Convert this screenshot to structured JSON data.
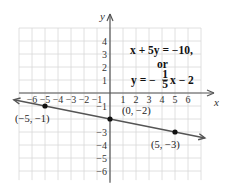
{
  "chart_data": {
    "type": "line",
    "title": "",
    "xlabel": "x",
    "ylabel": "y",
    "xlim": [
      -6,
      6
    ],
    "ylim": [
      -6,
      4
    ],
    "grid": true,
    "x_ticks": [
      "-6",
      "-5",
      "-4",
      "-3",
      "-2",
      "-1",
      "1",
      "2",
      "3",
      "4",
      "5",
      "6"
    ],
    "y_ticks": [
      "4",
      "3",
      "2",
      "1",
      "-1",
      "-3",
      "-4",
      "-5",
      "-6"
    ],
    "series": [
      {
        "name": "x + 5y = -10",
        "equation_slope_intercept": "y = -1/5 x - 2",
        "slope": -0.2,
        "intercept": -2
      }
    ],
    "points": [
      {
        "x": -5,
        "y": -1,
        "label": "(−5, −1)"
      },
      {
        "x": 0,
        "y": -2,
        "label": "(0, −2)"
      },
      {
        "x": 5,
        "y": -3,
        "label": "(5, −3)"
      }
    ],
    "annotations": {
      "eq1": "x + 5y = −10,",
      "or": "or",
      "eq2_prefix": "y = −",
      "eq2_num": "1",
      "eq2_den": "5",
      "eq2_suffix": "x − 2"
    }
  }
}
